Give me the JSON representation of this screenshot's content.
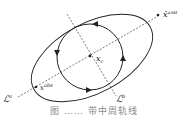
{
  "figure": {
    "labels": {
      "unstable_point": "x̄",
      "unstable_point_sup": "unst",
      "center": "x",
      "center_sub": "c",
      "observed_point": "x",
      "observed_point_sup": "obs",
      "line_a": "ℒ",
      "line_a_sup": "a",
      "line_b": "ℒ",
      "line_b_sup": "b"
    },
    "caption": "图 …… 带中周轨线",
    "colors": {
      "stroke": "#222222",
      "background": "#ffffff"
    }
  }
}
